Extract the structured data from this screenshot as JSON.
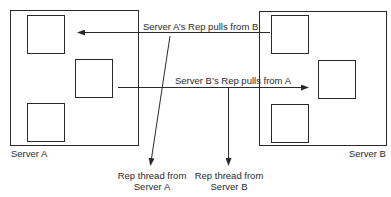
{
  "diagram": {
    "servers": [
      {
        "id": "A",
        "label": "Server A"
      },
      {
        "id": "B",
        "label": "Server B"
      }
    ],
    "arrows": [
      {
        "id": "a-pulls-from-b",
        "label": "Server A’s Rep pulls from B",
        "from": "B",
        "to": "A"
      },
      {
        "id": "b-pulls-from-a",
        "label": "Server B’s Rep pulls from A",
        "from": "A",
        "to": "B"
      }
    ],
    "threads": [
      {
        "id": "thread-a",
        "line1": "Rep thread from",
        "line2": "Server A"
      },
      {
        "id": "thread-b",
        "line1": "Rep thread from",
        "line2": "Server B"
      }
    ],
    "colors": {
      "stroke": "#2a2a2a",
      "background": "#ffffff"
    }
  }
}
